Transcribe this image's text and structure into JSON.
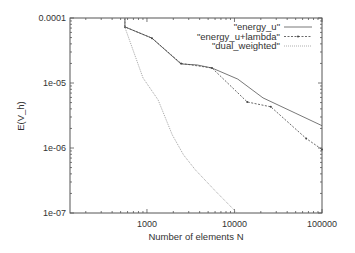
{
  "chart_data": {
    "type": "line",
    "title": "",
    "xlabel": "Number of elements N",
    "ylabel": "E(V_h)",
    "xscale": "log",
    "yscale": "log",
    "xlim": [
      132,
      100000
    ],
    "ylim": [
      1e-07,
      0.0001
    ],
    "grid": false,
    "legend_position": "upper right, inside",
    "x_ticks": [
      {
        "value": 1000,
        "label": "1000"
      },
      {
        "value": 10000,
        "label": "10000"
      },
      {
        "value": 100000,
        "label": "100000"
      }
    ],
    "y_ticks": [
      {
        "value": 0.0001,
        "label": "0.0001"
      },
      {
        "value": 1e-05,
        "label": "1e-05"
      },
      {
        "value": 1e-06,
        "label": "1e-06"
      },
      {
        "value": 1e-07,
        "label": "1e-07"
      }
    ],
    "series": [
      {
        "name": "\"energy_u\"",
        "style": "solid",
        "color": "#555555",
        "x": [
          560,
          560,
          1140,
          2450,
          3720,
          5530,
          10900,
          21200,
          49300,
          100000
        ],
        "y": [
          0.0001,
          7.3e-05,
          4.9e-05,
          1.96e-05,
          1.9e-05,
          1.7e-05,
          1.15e-05,
          5.9e-06,
          3.45e-06,
          2.2e-06
        ]
      },
      {
        "name": "\"energy_u+lambda\"",
        "style": "dashed-points",
        "color": "#444444",
        "x": [
          560,
          560,
          1140,
          2450,
          5530,
          14000,
          26000,
          66000,
          100000
        ],
        "y": [
          0.0001,
          7.3e-05,
          4.9e-05,
          2e-05,
          1.7e-05,
          5.1e-06,
          4.3e-06,
          1.4e-06,
          9.5e-07
        ]
      },
      {
        "name": "\"dual_weighted\"",
        "style": "dotted",
        "color": "#999999",
        "x": [
          560,
          560,
          900,
          1340,
          1940,
          2620,
          3580,
          6000,
          10700
        ],
        "y": [
          0.0001,
          7.2e-05,
          1.2e-05,
          5.5e-06,
          1.6e-06,
          7.8e-07,
          4.6e-07,
          2.2e-07,
          1e-07
        ]
      }
    ]
  }
}
